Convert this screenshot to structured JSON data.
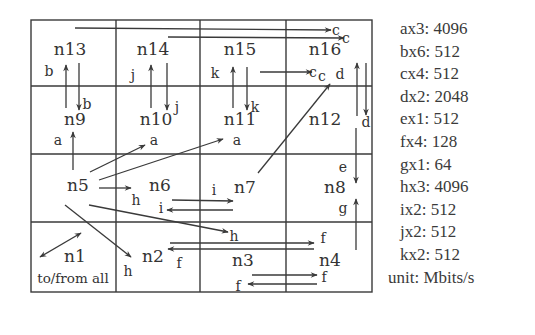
{
  "grid": {
    "rows": 4,
    "cols": 4,
    "x": [
      31,
      116,
      200,
      286,
      372
    ],
    "y": [
      20,
      86,
      154,
      222,
      292
    ]
  },
  "nodes": [
    {
      "id": "n13",
      "label": "n13",
      "x": 70,
      "y": 55
    },
    {
      "id": "n14",
      "label": "n14",
      "x": 153,
      "y": 55
    },
    {
      "id": "n15",
      "label": "n15",
      "x": 240,
      "y": 55
    },
    {
      "id": "n16",
      "label": "n16",
      "x": 325,
      "y": 55
    },
    {
      "id": "n9",
      "label": "n9",
      "x": 75,
      "y": 125
    },
    {
      "id": "n10",
      "label": "n10",
      "x": 156,
      "y": 125
    },
    {
      "id": "n11",
      "label": "n11",
      "x": 240,
      "y": 125
    },
    {
      "id": "n12",
      "label": "n12",
      "x": 325,
      "y": 125
    },
    {
      "id": "n5",
      "label": "n5",
      "x": 78,
      "y": 191
    },
    {
      "id": "n6",
      "label": "n6",
      "x": 160,
      "y": 191
    },
    {
      "id": "n7",
      "label": "n7",
      "x": 245,
      "y": 193
    },
    {
      "id": "n8",
      "label": "n8",
      "x": 335,
      "y": 193
    },
    {
      "id": "n1",
      "label": "n1",
      "x": 75,
      "y": 262
    },
    {
      "id": "n2",
      "label": "n2",
      "x": 153,
      "y": 262
    },
    {
      "id": "n3",
      "label": "n3",
      "x": 243,
      "y": 266
    },
    {
      "id": "n4",
      "label": "n4",
      "x": 330,
      "y": 266
    }
  ],
  "n1_caption": "to/from all",
  "flow_labels": [
    {
      "t": "c",
      "x": 336,
      "y": 35
    },
    {
      "t": "c",
      "x": 346,
      "y": 43
    },
    {
      "t": "b",
      "x": 49,
      "y": 76
    },
    {
      "t": "b",
      "x": 87,
      "y": 109
    },
    {
      "t": "j",
      "x": 133,
      "y": 80
    },
    {
      "t": "j",
      "x": 177,
      "y": 112
    },
    {
      "t": "k",
      "x": 215,
      "y": 78
    },
    {
      "t": "k",
      "x": 255,
      "y": 112
    },
    {
      "t": "c",
      "x": 313,
      "y": 77
    },
    {
      "t": "c",
      "x": 322,
      "y": 81
    },
    {
      "t": "d",
      "x": 340,
      "y": 79
    },
    {
      "t": "d",
      "x": 366,
      "y": 127
    },
    {
      "t": "a",
      "x": 58,
      "y": 145
    },
    {
      "t": "a",
      "x": 154,
      "y": 145
    },
    {
      "t": "a",
      "x": 237,
      "y": 145
    },
    {
      "t": "e",
      "x": 343,
      "y": 172
    },
    {
      "t": "h",
      "x": 136,
      "y": 205
    },
    {
      "t": "i",
      "x": 214,
      "y": 195
    },
    {
      "t": "i",
      "x": 161,
      "y": 213
    },
    {
      "t": "g",
      "x": 343,
      "y": 213
    },
    {
      "t": "h",
      "x": 234,
      "y": 241
    },
    {
      "t": "f",
      "x": 323,
      "y": 243
    },
    {
      "t": "h",
      "x": 128,
      "y": 276
    },
    {
      "t": "f",
      "x": 179,
      "y": 268
    },
    {
      "t": "f",
      "x": 324,
      "y": 282
    },
    {
      "t": "f",
      "x": 238,
      "y": 291
    }
  ],
  "legend": {
    "items": [
      "ax3: 4096",
      "bx6: 512",
      "cx4: 512",
      "dx2: 2048",
      "ex1: 512",
      "fx4: 128",
      "gx1: 64",
      "hx3: 4096",
      "ix2: 512",
      "jx2: 512",
      "kx2: 512"
    ],
    "unit": "unit: Mbits/s"
  },
  "colors": {
    "line": "#3a3a3a",
    "text": "#333333"
  }
}
